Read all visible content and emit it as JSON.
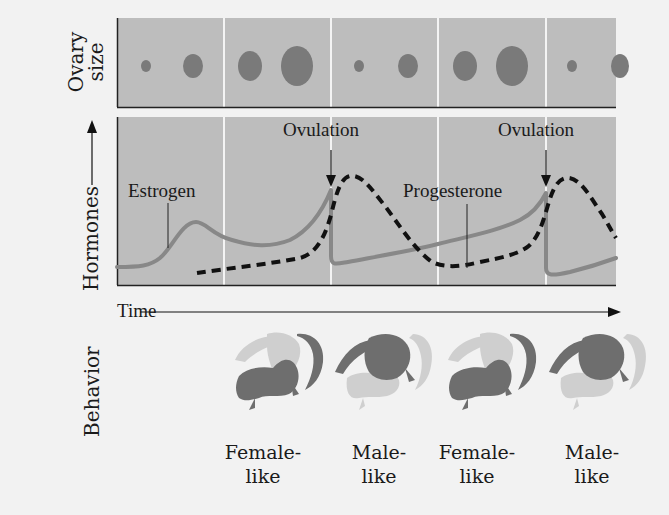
{
  "figure": {
    "type": "diagram",
    "background": "#f2f2f2",
    "panel_fill": "#bdbdbd",
    "divider_color": "#f4f4f4"
  },
  "ovary_panel": {
    "y_label_line1": "Ovary",
    "y_label_line2": "size",
    "dot_color": "#7a7a7a",
    "dots": [
      {
        "cx": 146,
        "cy": 66,
        "rx": 5,
        "ry": 6
      },
      {
        "cx": 193,
        "cy": 66,
        "rx": 10,
        "ry": 12
      },
      {
        "cx": 250,
        "cy": 66,
        "rx": 12,
        "ry": 15
      },
      {
        "cx": 297,
        "cy": 66,
        "rx": 16,
        "ry": 20
      },
      {
        "cx": 359,
        "cy": 66,
        "rx": 5,
        "ry": 6
      },
      {
        "cx": 408,
        "cy": 66,
        "rx": 10,
        "ry": 12
      },
      {
        "cx": 465,
        "cy": 66,
        "rx": 12,
        "ry": 15
      },
      {
        "cx": 512,
        "cy": 66,
        "rx": 16,
        "ry": 20
      },
      {
        "cx": 572,
        "cy": 66,
        "rx": 5,
        "ry": 6
      },
      {
        "cx": 620,
        "cy": 66,
        "rx": 9,
        "ry": 12
      }
    ]
  },
  "hormone_panel": {
    "y_label": "Hormones",
    "annotations": {
      "ovulation_1": "Ovulation",
      "ovulation_2": "Ovulation",
      "estrogen": "Estrogen",
      "progesterone": "Progesterone"
    },
    "series": [
      {
        "name": "Estrogen",
        "style": "solid",
        "color": "#888888"
      },
      {
        "name": "Progesterone",
        "style": "dashed",
        "color": "#111111"
      }
    ]
  },
  "time_axis": {
    "label": "Time"
  },
  "behavior_panel": {
    "y_label": "Behavior",
    "phases": [
      {
        "line1": "Female-",
        "line2": "like",
        "mode": "female"
      },
      {
        "line1": "Male-",
        "line2": "like",
        "mode": "male"
      },
      {
        "line1": "Female-",
        "line2": "like",
        "mode": "female"
      },
      {
        "line1": "Male-",
        "line2": "like",
        "mode": "male"
      }
    ],
    "lizard_dark": "#6e6e6e",
    "lizard_light": "#cfcfcf"
  }
}
